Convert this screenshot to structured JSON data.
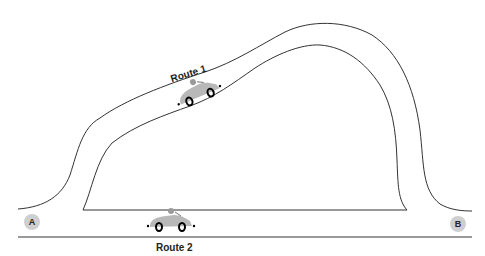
{
  "diagram": {
    "routes": [
      {
        "label": "Route 1"
      },
      {
        "label": "Route 2"
      }
    ],
    "points": [
      {
        "label": "A"
      },
      {
        "label": "B"
      }
    ],
    "colors": {
      "line": "#333333",
      "car": "#b8b8b8",
      "point": "#cfcfcf"
    }
  }
}
